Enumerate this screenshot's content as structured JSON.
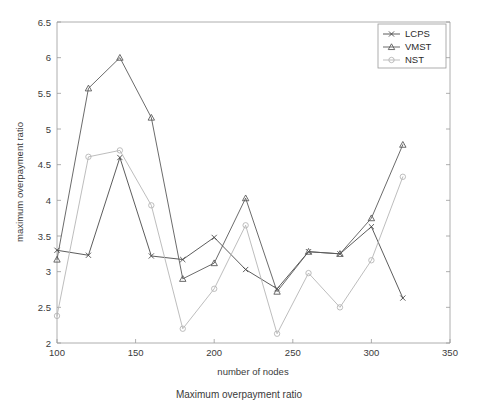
{
  "chart_data": {
    "type": "line",
    "title": "",
    "xlabel": "number of nodes",
    "ylabel": "maximum overpayment ratio",
    "caption": "Maximum overpayment ratio",
    "x": [
      100,
      120,
      140,
      160,
      180,
      200,
      220,
      240,
      260,
      280,
      300,
      320
    ],
    "xlim": [
      100,
      350
    ],
    "ylim": [
      2,
      6.5
    ],
    "xticks": [
      "100",
      "150",
      "200",
      "250",
      "300",
      "350"
    ],
    "xtick_values": [
      100,
      150,
      200,
      250,
      300,
      350
    ],
    "yticks": [
      "2",
      "2.5",
      "3",
      "3.5",
      "4",
      "4.5",
      "5",
      "5.5",
      "6",
      "6.5"
    ],
    "ytick_values": [
      2,
      2.5,
      3,
      3.5,
      4,
      4.5,
      5,
      5.5,
      6,
      6.5
    ],
    "grid": false,
    "legend_position": "top-right",
    "series": [
      {
        "name": "LCPS",
        "marker": "x",
        "color": "#4a4a4a",
        "values": [
          3.3,
          3.23,
          4.6,
          3.22,
          3.17,
          3.48,
          3.03,
          2.76,
          3.28,
          3.25,
          3.63,
          2.63
        ]
      },
      {
        "name": "VMST",
        "marker": "triangle",
        "color": "#5a5a5a",
        "values": [
          3.17,
          5.57,
          6.0,
          5.16,
          2.9,
          3.12,
          4.03,
          2.72,
          3.28,
          3.25,
          3.75,
          4.78
        ]
      },
      {
        "name": "NST",
        "marker": "circle",
        "color": "#b5b5b5",
        "values": [
          2.38,
          4.61,
          4.7,
          3.93,
          2.2,
          2.76,
          3.65,
          2.13,
          2.98,
          2.5,
          3.16,
          4.33
        ]
      }
    ]
  },
  "legend": {
    "entries": [
      "LCPS",
      "VMST",
      "NST"
    ]
  },
  "axes": {
    "x_title": "number of nodes",
    "y_title": "maximum overpayment ratio"
  },
  "caption": {
    "text": "Maximum overpayment ratio"
  }
}
